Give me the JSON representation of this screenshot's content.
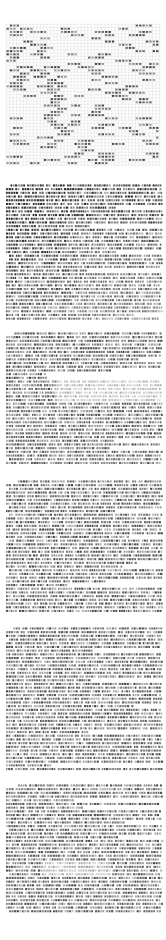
{
  "document": {
    "view": "page-thumbnail-strip",
    "orientation": "vertical",
    "page_count": 6,
    "background_color": "#ffffff",
    "ink_color": "#2b2b2b",
    "grid_color": "#d8d8d8",
    "width_px": 166,
    "height_px": 940
  },
  "pages": [
    {
      "index": 1,
      "label": "1",
      "kind": "table",
      "top": 0,
      "height": 172,
      "content_box": {
        "left": 6,
        "top": 24,
        "right": 161,
        "bottom": 166
      },
      "grid": {
        "cols": 46,
        "rows": 44,
        "cell_w": 3.4,
        "cell_h": 3.2,
        "visible": true
      },
      "fill_density": 0.17,
      "notes": "sparse matrix of short dark cell clusters on faint ruled grid"
    },
    {
      "index": 2,
      "label": "2",
      "kind": "text",
      "top": 182,
      "height": 140,
      "content_box": {
        "left": 6,
        "top": 184,
        "right": 161,
        "bottom": 321
      },
      "lines": 37,
      "line_height": 3.7,
      "indent_first": true,
      "notes": "dense body text, heavier ink in upper-left block"
    },
    {
      "index": 3,
      "label": "3",
      "kind": "text",
      "top": 330,
      "height": 138,
      "content_box": {
        "left": 6,
        "top": 332,
        "right": 161,
        "bottom": 467
      },
      "lines": 37,
      "line_height": 3.7,
      "indent_first": true,
      "notes": "dense body text with a light gap band mid-page"
    },
    {
      "index": 4,
      "label": "4",
      "kind": "text",
      "top": 478,
      "height": 137,
      "content_box": {
        "left": 6,
        "top": 480,
        "right": 161,
        "bottom": 614
      },
      "lines": 36,
      "line_height": 3.7,
      "indent_first": true,
      "notes": "dense body text, short closing line"
    },
    {
      "index": 5,
      "label": "5",
      "kind": "text",
      "top": 625,
      "height": 147,
      "content_box": {
        "left": 6,
        "top": 627,
        "right": 161,
        "bottom": 771
      },
      "lines": 39,
      "line_height": 3.7,
      "indent_first": true,
      "notes": "uniformly dense body text"
    },
    {
      "index": 6,
      "label": "6",
      "kind": "text",
      "top": 782,
      "height": 133,
      "content_box": {
        "left": 6,
        "top": 784,
        "right": 161,
        "bottom": 914
      },
      "lines": 35,
      "line_height": 3.7,
      "indent_first": true,
      "notes": "dense body text, trailing blank area at page foot"
    }
  ]
}
